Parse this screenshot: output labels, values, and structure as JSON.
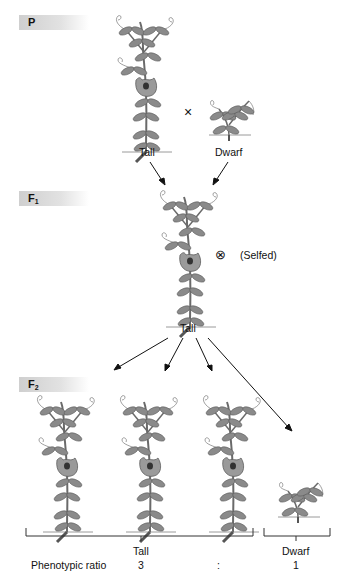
{
  "generations": {
    "p": {
      "label": "P",
      "sub": ""
    },
    "f1": {
      "label": "F",
      "sub": "1"
    },
    "f2": {
      "label": "F",
      "sub": "2"
    }
  },
  "parental": {
    "cross_symbol": "×",
    "tall_label": "Tall",
    "dwarf_label": "Dwarf"
  },
  "f1": {
    "selfed_symbol": "⊗",
    "selfed_label": "(Selfed)",
    "plant_label": "Tall"
  },
  "f2": {
    "tall_group_label": "Tall",
    "dwarf_group_label": "Dwarf",
    "ratio_label": "Phenotypic ratio",
    "ratio_tall": "3",
    "ratio_sep": ":",
    "ratio_dwarf": "1"
  },
  "colors": {
    "leaf": "#8a8a8a",
    "leaf_dark": "#5e5e5e",
    "stem": "#6a6a6a",
    "flower": "#9a9a9a",
    "bar": "#d4d4d4"
  }
}
